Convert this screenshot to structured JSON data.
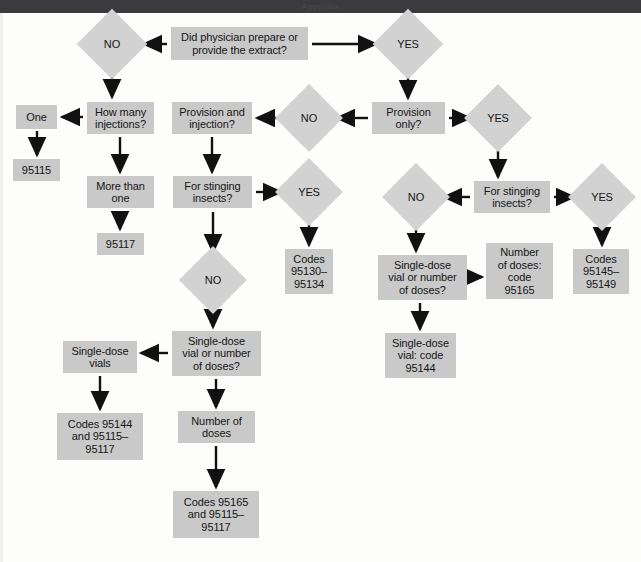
{
  "banner": {
    "ghost_text": "Appendix",
    "color": "#3b3b3d"
  },
  "colors": {
    "box_fill": "#c9c9c9",
    "diamond_fill": "#d2d2d2",
    "text": "#151515",
    "arrow": "#111111",
    "page_background": "#fdfdfc"
  },
  "chart_data": {
    "type": "diagram",
    "nodes": [
      {
        "id": "n1",
        "shape": "box",
        "label": "Did physician prepare or\nprovide the extract?",
        "x": 171,
        "y": 27,
        "w": 137,
        "h": 33
      },
      {
        "id": "n2",
        "shape": "diamond",
        "label": "NO",
        "x": 87,
        "y": 19,
        "w": 50,
        "h": 50
      },
      {
        "id": "n3",
        "shape": "diamond",
        "label": "YES",
        "x": 383,
        "y": 19,
        "w": 50,
        "h": 50
      },
      {
        "id": "n4",
        "shape": "box",
        "label": "How many\ninjections?",
        "x": 87,
        "y": 102,
        "w": 67,
        "h": 32
      },
      {
        "id": "n5",
        "shape": "box",
        "label": "One",
        "x": 16,
        "y": 105,
        "w": 41,
        "h": 24
      },
      {
        "id": "n6",
        "shape": "box",
        "label": "95115",
        "x": 13,
        "y": 159,
        "w": 47,
        "h": 22
      },
      {
        "id": "n7",
        "shape": "box",
        "label": "More than\none",
        "x": 87,
        "y": 176,
        "w": 67,
        "h": 32
      },
      {
        "id": "n8",
        "shape": "box",
        "label": "95117",
        "x": 97,
        "y": 233,
        "w": 47,
        "h": 22
      },
      {
        "id": "n9",
        "shape": "box",
        "label": "Provision and\ninjection?",
        "x": 172,
        "y": 102,
        "w": 80,
        "h": 32
      },
      {
        "id": "n10",
        "shape": "diamond",
        "label": "NO",
        "x": 285,
        "y": 94,
        "w": 48,
        "h": 48
      },
      {
        "id": "n11",
        "shape": "box",
        "label": "Provision\nonly?",
        "x": 372,
        "y": 102,
        "w": 73,
        "h": 32
      },
      {
        "id": "n12",
        "shape": "diamond",
        "label": "YES",
        "x": 474,
        "y": 94,
        "w": 48,
        "h": 48
      },
      {
        "id": "n13",
        "shape": "box",
        "label": "For stinging\ninsects?",
        "x": 173,
        "y": 176,
        "w": 79,
        "h": 32
      },
      {
        "id": "n14",
        "shape": "diamond",
        "label": "YES",
        "x": 285,
        "y": 168,
        "w": 48,
        "h": 48
      },
      {
        "id": "n15",
        "shape": "box",
        "label": "Codes\n95130–\n95134",
        "x": 285,
        "y": 249,
        "w": 48,
        "h": 45
      },
      {
        "id": "n16",
        "shape": "diamond",
        "label": "NO",
        "x": 189,
        "y": 256,
        "w": 48,
        "h": 48
      },
      {
        "id": "n17",
        "shape": "box",
        "label": "Single-dose\nvial or number\nof doses?",
        "x": 172,
        "y": 331,
        "w": 89,
        "h": 45
      },
      {
        "id": "n18",
        "shape": "box",
        "label": "Single-dose\nvials",
        "x": 63,
        "y": 341,
        "w": 74,
        "h": 32
      },
      {
        "id": "n19",
        "shape": "box",
        "label": "Codes 95144\nand 95115–\n95117",
        "x": 57,
        "y": 413,
        "w": 86,
        "h": 47
      },
      {
        "id": "n20",
        "shape": "box",
        "label": "Number of\ndoses",
        "x": 178,
        "y": 411,
        "w": 77,
        "h": 32
      },
      {
        "id": "n21",
        "shape": "box",
        "label": "Codes 95165\nand 95115–\n95117",
        "x": 173,
        "y": 491,
        "w": 86,
        "h": 47
      },
      {
        "id": "n22",
        "shape": "box",
        "label": "For stinging\ninsects?",
        "x": 474,
        "y": 181,
        "w": 76,
        "h": 32
      },
      {
        "id": "n23",
        "shape": "diamond",
        "label": "NO",
        "x": 392,
        "y": 173,
        "w": 48,
        "h": 48
      },
      {
        "id": "n24",
        "shape": "diamond",
        "label": "YES",
        "x": 578,
        "y": 173,
        "w": 48,
        "h": 48
      },
      {
        "id": "n25",
        "shape": "box",
        "label": "Single-dose\nvial or number\nof doses?",
        "x": 378,
        "y": 255,
        "w": 89,
        "h": 45
      },
      {
        "id": "n26",
        "shape": "box",
        "label": "Number\nof doses:\ncode\n95165",
        "x": 486,
        "y": 243,
        "w": 67,
        "h": 56
      },
      {
        "id": "n27",
        "shape": "box",
        "label": "Codes\n95145–\n95149",
        "x": 573,
        "y": 249,
        "w": 56,
        "h": 45
      },
      {
        "id": "n28",
        "shape": "box",
        "label": "Single-dose\nvial: code\n95144",
        "x": 385,
        "y": 333,
        "w": 71,
        "h": 45
      }
    ],
    "edges": [
      {
        "from": "n1",
        "to": "n2",
        "kind": "left"
      },
      {
        "from": "n1",
        "to": "n3",
        "kind": "right"
      },
      {
        "from": "n2",
        "to": "n4",
        "kind": "down"
      },
      {
        "from": "n4",
        "to": "n5",
        "kind": "left"
      },
      {
        "from": "n5",
        "to": "n6",
        "kind": "down"
      },
      {
        "from": "n4",
        "to": "n7",
        "kind": "down"
      },
      {
        "from": "n7",
        "to": "n8",
        "kind": "down"
      },
      {
        "from": "n3",
        "to": "n11",
        "kind": "down"
      },
      {
        "from": "n10",
        "to": "n9",
        "kind": "left"
      },
      {
        "from": "n11",
        "to": "n10",
        "kind": "left"
      },
      {
        "from": "n11",
        "to": "n12",
        "kind": "right"
      },
      {
        "from": "n9",
        "to": "n13",
        "kind": "down"
      },
      {
        "from": "n13",
        "to": "n14",
        "kind": "right"
      },
      {
        "from": "n14",
        "to": "n15",
        "kind": "down"
      },
      {
        "from": "n13",
        "to": "n16",
        "kind": "down"
      },
      {
        "from": "n16",
        "to": "n17",
        "kind": "down"
      },
      {
        "from": "n17",
        "to": "n18",
        "kind": "left"
      },
      {
        "from": "n18",
        "to": "n19",
        "kind": "down"
      },
      {
        "from": "n17",
        "to": "n20",
        "kind": "down"
      },
      {
        "from": "n20",
        "to": "n21",
        "kind": "down"
      },
      {
        "from": "n12",
        "to": "n22",
        "kind": "down"
      },
      {
        "from": "n22",
        "to": "n23",
        "kind": "left"
      },
      {
        "from": "n22",
        "to": "n24",
        "kind": "right"
      },
      {
        "from": "n23",
        "to": "n25",
        "kind": "down"
      },
      {
        "from": "n25",
        "to": "n26",
        "kind": "right"
      },
      {
        "from": "n24",
        "to": "n27",
        "kind": "down"
      },
      {
        "from": "n25",
        "to": "n28",
        "kind": "down"
      }
    ],
    "arrow_paths": [
      {
        "name": "arrow-question-to-no",
        "d": "M 167 44 L 144 44",
        "head": "left"
      },
      {
        "name": "arrow-question-to-yes",
        "d": "M 312 44 L 376 44",
        "head": "right"
      },
      {
        "name": "arrow-no-to-howmany",
        "d": "M 112 72 L 112 97",
        "head": "down"
      },
      {
        "name": "arrow-howmany-to-one",
        "d": "M 83 117 L 62 117",
        "head": "left"
      },
      {
        "name": "arrow-one-to-95115",
        "d": "M 37 131 L 37 155",
        "head": "down"
      },
      {
        "name": "arrow-howmany-to-morethan",
        "d": "M 120 137 L 120 172",
        "head": "down"
      },
      {
        "name": "arrow-morethan-to-95117",
        "d": "M 120 211 L 120 229",
        "head": "down"
      },
      {
        "name": "arrow-yes-to-provisiononly",
        "d": "M 408 72 L 408 98",
        "head": "down"
      },
      {
        "name": "arrow-no2-to-provisioninj",
        "d": "M 281 118 L 257 118",
        "head": "left"
      },
      {
        "name": "arrow-provisiononly-to-no2",
        "d": "M 368 118 L 337 118",
        "head": "left"
      },
      {
        "name": "arrow-provisiononly-to-yes2",
        "d": "M 449 118 L 470 118",
        "head": "right"
      },
      {
        "name": "arrow-provisioninj-to-sting",
        "d": "M 212 137 L 212 172",
        "head": "down"
      },
      {
        "name": "arrow-sting-to-yes3",
        "d": "M 256 192 L 281 192",
        "head": "right"
      },
      {
        "name": "arrow-yes3-to-codes95130",
        "d": "M 309 219 L 309 245",
        "head": "down"
      },
      {
        "name": "arrow-sting-to-no3",
        "d": "M 213 212 L 213 252",
        "head": "down"
      },
      {
        "name": "arrow-no3-to-singledoseq",
        "d": "M 213 307 L 213 327",
        "head": "down"
      },
      {
        "name": "arrow-singledoseq-to-vials",
        "d": "M 168 353 L 141 353",
        "head": "left"
      },
      {
        "name": "arrow-vials-to-codes95144",
        "d": "M 100 376 L 100 409",
        "head": "down"
      },
      {
        "name": "arrow-singledoseq-to-numdoses",
        "d": "M 216 379 L 216 407",
        "head": "down"
      },
      {
        "name": "arrow-numdoses-to-codes95165",
        "d": "M 216 446 L 216 487",
        "head": "down"
      },
      {
        "name": "arrow-yes2-to-sting2",
        "d": "M 498 145 L 498 177",
        "head": "down"
      },
      {
        "name": "arrow-sting2-to-no4",
        "d": "M 470 197 L 444 197",
        "head": "left"
      },
      {
        "name": "arrow-sting2-to-yes4",
        "d": "M 554 197 L 574 197",
        "head": "right"
      },
      {
        "name": "arrow-no4-to-singledoseq2",
        "d": "M 416 224 L 416 251",
        "head": "down"
      },
      {
        "name": "arrow-singledoseq2-to-numdos",
        "d": "M 471 277 L 482 277",
        "head": "right"
      },
      {
        "name": "arrow-yes4-to-codes95145",
        "d": "M 602 224 L 602 245",
        "head": "down"
      },
      {
        "name": "arrow-singledoseq2-to-vial",
        "d": "M 420 303 L 420 329",
        "head": "down"
      }
    ]
  }
}
